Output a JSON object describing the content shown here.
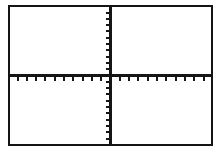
{
  "screen": {
    "width": 222,
    "height": 153,
    "background_color": "#ffffff",
    "ink_color": "#151515"
  },
  "plot_frame": {
    "border_color": "#151515",
    "border_width_px": 2,
    "fill_color": "#ffffff",
    "left_px": 8,
    "top_px": 5,
    "width_px": 205,
    "height_px": 141
  },
  "chart_data": {
    "type": "scatter",
    "title": "",
    "subtitle": "",
    "xlabel": "",
    "ylabel": "",
    "series": [],
    "x": [],
    "values": [],
    "annotations": [],
    "legend": {
      "entries": [],
      "position": "none",
      "visible": false
    },
    "grid": {
      "visible": false
    },
    "axes": {
      "x_axis": {
        "visible": true,
        "orientation": "horizontal",
        "origin_fraction": 0.5,
        "line_color": "#151515",
        "line_width_px": 2,
        "tick_labels": [],
        "tick_count_negative": 10,
        "tick_count_positive": 10,
        "tick_spacing_px": 9.3,
        "tick_length_px": 5,
        "tick_direction": "down"
      },
      "y_axis": {
        "visible": true,
        "orientation": "vertical",
        "origin_fraction": 0.5,
        "line_color": "#151515",
        "line_width_px": 2,
        "tick_labels": [],
        "tick_count_positive": 10,
        "tick_count_negative": 11,
        "tick_spacing_px": 6.3,
        "tick_length_px": 5,
        "tick_direction": "left"
      },
      "xlim": [
        -10,
        10
      ],
      "ylim": [
        -10,
        10
      ]
    },
    "quadrants": [
      {
        "name": "quadrant-i",
        "content": ""
      },
      {
        "name": "quadrant-ii",
        "content": ""
      },
      {
        "name": "quadrant-iii",
        "content": ""
      },
      {
        "name": "quadrant-iv",
        "content": ""
      }
    ]
  }
}
